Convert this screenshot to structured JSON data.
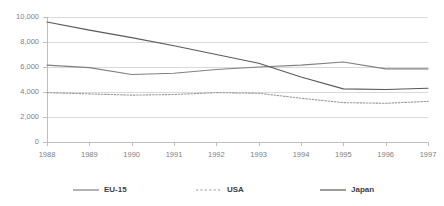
{
  "chart_data": {
    "type": "line",
    "title": "",
    "subtitle": "",
    "xlabel": "",
    "ylabel": "",
    "categories": [
      "1988",
      "1989",
      "1990",
      "1991",
      "1992",
      "1993",
      "1994",
      "1995",
      "1996",
      "1997"
    ],
    "x": [
      1988,
      1989,
      1990,
      1991,
      1992,
      1993,
      1994,
      1995,
      1996,
      1997
    ],
    "ylim": [
      0,
      10000
    ],
    "yticks": [
      0,
      2000,
      4000,
      6000,
      8000,
      10000
    ],
    "ytick_labels": [
      "0",
      "2,000",
      "4,000",
      "6,000",
      "8,000",
      "10,000"
    ],
    "grid": "horizontal",
    "legend_position": "bottom",
    "series": [
      {
        "name": "EU-15",
        "style": "solid",
        "color": "#808080",
        "values": [
          6150,
          5950,
          5400,
          5500,
          5800,
          6000,
          6150,
          6400,
          5850,
          5850
        ]
      },
      {
        "name": "USA",
        "style": "dotted",
        "color": "#999999",
        "values": [
          3950,
          3850,
          3750,
          3800,
          3950,
          3900,
          3500,
          3150,
          3100,
          3250
        ]
      },
      {
        "name": "Japan",
        "style": "solid",
        "color": "#595959",
        "values": [
          9600,
          8950,
          8350,
          7700,
          7000,
          6300,
          5200,
          4250,
          4200,
          4300
        ]
      }
    ]
  },
  "axis": {
    "y_tick_labels": [
      "10,000",
      "8,000",
      "6,000",
      "4,000",
      "2,000",
      "0"
    ],
    "x_tick_labels": [
      "1988",
      "1989",
      "1990",
      "1991",
      "1992",
      "1993",
      "1994",
      "1995",
      "1996",
      "1997"
    ]
  },
  "legend": {
    "items": [
      {
        "label": "EU-15",
        "style": "solid",
        "color": "#808080"
      },
      {
        "label": "USA",
        "style": "dotted",
        "color": "#999999"
      },
      {
        "label": "Japan",
        "style": "solid",
        "color": "#595959"
      }
    ]
  },
  "colors": {
    "background": "#ffffff",
    "gridline": "#d9d9d9",
    "axis": "#bfbfbf",
    "tick_text": "#808080",
    "legend_text": "#404040"
  }
}
